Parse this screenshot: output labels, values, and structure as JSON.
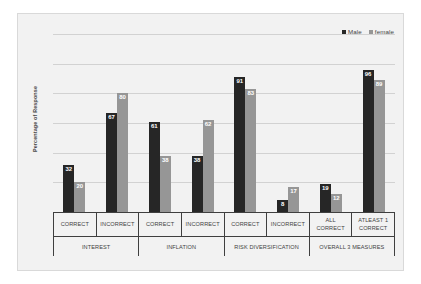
{
  "legend": {
    "position": "top-right",
    "entries": [
      {
        "label": "Male",
        "color": "#262626"
      },
      {
        "label": "female",
        "color": "#969696"
      }
    ]
  },
  "axis": {
    "y_title": "Percentage of Response"
  },
  "chart_data": {
    "type": "bar",
    "title": "",
    "subtitle": "",
    "xlabel": "",
    "ylabel": "Percentage of Response",
    "ylim": [
      0,
      120
    ],
    "yticks": [
      0,
      20,
      40,
      60,
      80,
      100,
      120
    ],
    "grid": true,
    "legend_position": "top-right",
    "categories": [
      "CORRECT",
      "INCORRECT",
      "CORRECT",
      "INCORRECT",
      "CORRECT",
      "INCORRECT",
      "ALL CORRECT",
      "ATLEAST 1 CORRECT"
    ],
    "groups": [
      {
        "label": "INTEREST",
        "subcategories": [
          "CORRECT",
          "INCORRECT"
        ]
      },
      {
        "label": "INFLATION",
        "subcategories": [
          "CORRECT",
          "INCORRECT"
        ]
      },
      {
        "label": "RISK DIVERSIFICATION",
        "subcategories": [
          "CORRECT",
          "INCORRECT"
        ]
      },
      {
        "label": "OVERALL 3 MEASURES",
        "subcategories": [
          "ALL CORRECT",
          "ATLEAST 1 CORRECT"
        ]
      }
    ],
    "series": [
      {
        "name": "Male",
        "color": "#262626",
        "values": [
          32,
          67,
          61,
          38,
          91,
          8,
          19,
          96
        ]
      },
      {
        "name": "female",
        "color": "#969696",
        "values": [
          20,
          80,
          38,
          62,
          83,
          17,
          12,
          89
        ]
      }
    ]
  }
}
